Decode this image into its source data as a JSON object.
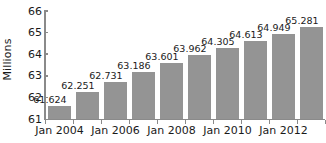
{
  "chart_data": {
    "type": "bar",
    "title": "",
    "subtitle": "",
    "xlabel": "",
    "ylabel": "Millions",
    "categories": [
      "Jan 2004",
      "Jan 2005",
      "Jan 2006",
      "Jan 2007",
      "Jan 2008",
      "Jan 2009",
      "Jan 2010",
      "Jan 2011",
      "Jan 2012",
      "Jan 2013"
    ],
    "values": [
      61.624,
      62.251,
      62.731,
      63.186,
      63.601,
      63.962,
      64.305,
      64.613,
      64.949,
      65.281
    ],
    "data_labels": [
      "61.624",
      "62.251",
      "62.731",
      "63.186",
      "63.601",
      "63.962",
      "64.305",
      "64.613",
      "64.949",
      "65.281"
    ],
    "ylim": [
      61,
      66
    ],
    "ytick_labels": [
      "61",
      "62",
      "63",
      "64",
      "65",
      "66"
    ],
    "ytick_values": [
      61,
      62,
      63,
      64,
      65,
      66
    ],
    "xtick_labels": [
      "Jan 2004",
      "Jan 2006",
      "Jan 2008",
      "Jan 2010",
      "Jan 2012"
    ],
    "xtick_label_indices": [
      0,
      2,
      4,
      6,
      8
    ],
    "grid": false,
    "legend": false,
    "bar_color": "#949494",
    "axis_color": "#8a8a8a",
    "text_color": "#1a1a1a",
    "background_color": "#ffffff"
  }
}
